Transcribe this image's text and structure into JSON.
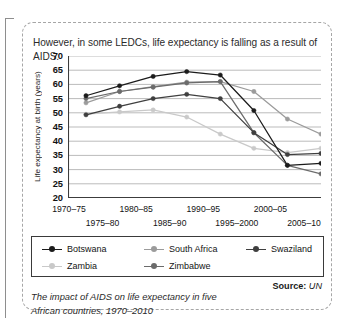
{
  "intro_text": "However, in some LEDCs, life expectancy is falling as a result of AIDS.",
  "caption": "The impact of AIDS on life expectancy in five African countries, 1970–2010",
  "source": {
    "label": "Source:",
    "value": "UN"
  },
  "chart_data": {
    "type": "line",
    "title": "",
    "xlabel": "",
    "ylabel": "Life expectancy at birth (years)",
    "ylim": [
      20,
      70
    ],
    "ytick_step": 5,
    "yticks": [
      70,
      65,
      60,
      55,
      50,
      45,
      40,
      35,
      30,
      25,
      20
    ],
    "grid": true,
    "legend_position": "bottom",
    "categories": [
      "1970–75",
      "1975–80",
      "1980–85",
      "1985–90",
      "1990–95",
      "1995–2000",
      "2000–05",
      "2005–10"
    ],
    "categories_row1": [
      "1970–75",
      "1980–85",
      "1990–95",
      "2000–05"
    ],
    "categories_row2": [
      "1975–80",
      "1985–90",
      "1995–2000",
      "2005–10"
    ],
    "series": [
      {
        "name": "Botswana",
        "color": "#1b1b1b",
        "values": [
          56.0,
          59.5,
          62.8,
          64.5,
          63.3,
          50.8,
          31.5,
          32.2
        ]
      },
      {
        "name": "South Africa",
        "color": "#9b9b9b",
        "values": [
          53.5,
          57.5,
          59.2,
          60.8,
          61.0,
          57.5,
          47.8,
          42.5
        ]
      },
      {
        "name": "Swaziland",
        "color": "#3f3f3f",
        "values": [
          49.3,
          52.3,
          55.0,
          56.5,
          55.0,
          43.0,
          35.3,
          35.7
        ]
      },
      {
        "name": "Zambia",
        "color": "#c9c9c9",
        "values": [
          49.5,
          50.3,
          51.0,
          48.5,
          42.5,
          37.5,
          36.0,
          37.5
        ]
      },
      {
        "name": "Zimbabwe",
        "color": "#6b6b6b",
        "values": [
          55.0,
          57.5,
          59.0,
          60.5,
          61.0,
          43.0,
          31.5,
          28.5
        ]
      }
    ]
  }
}
